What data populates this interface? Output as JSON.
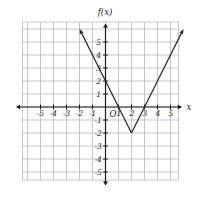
{
  "figure": {
    "background_color": "#ffffff",
    "grid_color": "#b9b9bd",
    "axis_color": "#1a1a1a",
    "curve_color": "#2b2b2b",
    "label_color": "#1a1a1a",
    "axis_label_x": "x",
    "axis_label_y": "f(x)",
    "origin_label": "O"
  },
  "chart_data": {
    "type": "line",
    "title": "",
    "xlabel": "x",
    "ylabel": "f(x)",
    "grid": true,
    "legend": "none",
    "xlim": [
      -6,
      6
    ],
    "ylim": [
      -6,
      6
    ],
    "xticks": [
      -5,
      -4,
      -3,
      -2,
      -1,
      1,
      2,
      3,
      4,
      5
    ],
    "yticks": [
      -5,
      -4,
      -3,
      -2,
      -1,
      1,
      2,
      3,
      4,
      5
    ],
    "xtick_labels": [
      "-5",
      "-4",
      "-3",
      "-2",
      "-1",
      "1",
      "2",
      "3",
      "4",
      "5"
    ],
    "ytick_labels": [
      "-5",
      "-4",
      "-3",
      "-2",
      "-1",
      "1",
      "2",
      "3",
      "4",
      "5"
    ],
    "series": [
      {
        "name": "f(x)",
        "shape": "absolute-value-v",
        "vertex": [
          2,
          -2
        ],
        "left_slope": -2,
        "right_slope": 2,
        "x_intercepts": [
          1,
          3
        ],
        "y_intercept": 2,
        "points": [
          [
            -2,
            6
          ],
          [
            0,
            2
          ],
          [
            1,
            0
          ],
          [
            2,
            -2
          ],
          [
            3,
            0
          ],
          [
            5,
            4
          ],
          [
            5.5,
            5
          ]
        ]
      }
    ],
    "annotations": []
  },
  "ticks": {
    "x_negative": [
      {
        "label": "-5",
        "value": -5
      },
      {
        "label": "-4",
        "value": -4
      },
      {
        "label": "-3",
        "value": -3
      },
      {
        "label": "-2",
        "value": -2
      },
      {
        "label": "-1",
        "value": -1
      }
    ],
    "x_positive": [
      {
        "label": "1",
        "value": 1
      },
      {
        "label": "2",
        "value": 2
      },
      {
        "label": "3",
        "value": 3
      },
      {
        "label": "4",
        "value": 4
      },
      {
        "label": "5",
        "value": 5
      }
    ],
    "y_positive": [
      {
        "label": "5",
        "value": 5
      },
      {
        "label": "4",
        "value": 4
      },
      {
        "label": "3",
        "value": 3
      },
      {
        "label": "2",
        "value": 2
      },
      {
        "label": "1",
        "value": 1
      }
    ],
    "y_negative": [
      {
        "label": "-1",
        "value": -1
      },
      {
        "label": "-2",
        "value": -2
      },
      {
        "label": "-3",
        "value": -3
      },
      {
        "label": "-4",
        "value": -4
      },
      {
        "label": "-5",
        "value": -5
      }
    ]
  }
}
